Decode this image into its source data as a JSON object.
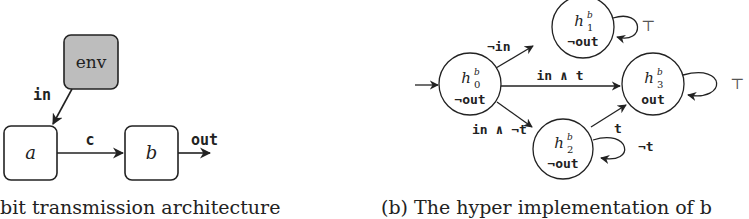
{
  "panel_a": {
    "caption": "bit transmission architecture",
    "nodes": {
      "env": {
        "label": "env",
        "fill": "#bdbdbd"
      },
      "a": {
        "label": "a"
      },
      "b": {
        "label": "b"
      }
    },
    "edges": {
      "env_to_a": {
        "label": "in"
      },
      "a_to_b": {
        "label": "c"
      },
      "b_out": {
        "label": "out"
      }
    }
  },
  "panel_b": {
    "caption": "(b) The hyper implementation of b",
    "states": {
      "h0": {
        "name": "h",
        "sup": "b",
        "sub": "0",
        "output": "¬out"
      },
      "h1": {
        "name": "h",
        "sup": "b",
        "sub": "1",
        "output": "¬out"
      },
      "h2": {
        "name": "h",
        "sup": "b",
        "sub": "2",
        "output": "¬out"
      },
      "h3": {
        "name": "h",
        "sup": "b",
        "sub": "3",
        "output": "out"
      }
    },
    "transitions": {
      "h0_h1": {
        "label": "¬in"
      },
      "h0_h3": {
        "label": "in ∧ t"
      },
      "h0_h2": {
        "label": "in ∧ ¬t"
      },
      "h2_h3": {
        "label": "t"
      },
      "h2_loop": {
        "label": "¬t"
      },
      "h1_loop": {
        "label": "⊤"
      },
      "h3_loop": {
        "label": "⊤"
      }
    }
  }
}
